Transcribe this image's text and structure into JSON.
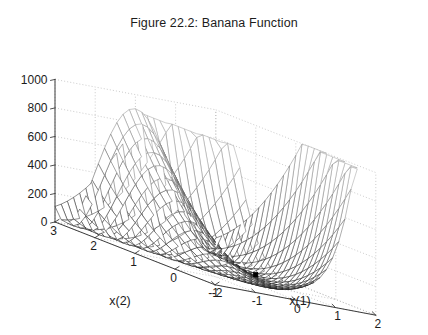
{
  "figure": {
    "title": "Figure 22.2: Banana Function",
    "background_color": "#ffffff",
    "axis_color": "#3c3c3c",
    "grid_color": "#b4b4b4",
    "mesh_color": "#303030",
    "marker_color": "#000000"
  },
  "axes": {
    "x1": {
      "label": "x(1)",
      "ticks": [
        "-2",
        "-1",
        "0",
        "1",
        "2"
      ],
      "tick_values": [
        -2,
        -1,
        0,
        1,
        2
      ],
      "range": [
        -2,
        2
      ]
    },
    "x2": {
      "label": "x(2)",
      "ticks": [
        "3",
        "2",
        "1",
        "0",
        "-1"
      ],
      "tick_values": [
        3,
        2,
        1,
        0,
        -1
      ],
      "range": [
        -1,
        3
      ]
    },
    "z": {
      "label": "",
      "ticks": [
        "0",
        "200",
        "400",
        "600",
        "800",
        "1000"
      ],
      "tick_values": [
        0,
        200,
        400,
        600,
        800,
        1000
      ],
      "range": [
        0,
        1000
      ]
    }
  },
  "marker": {
    "name": "minimum-marker",
    "x1": 1,
    "x2": 1,
    "z": 0,
    "size_px": 4.5
  },
  "chart_data": {
    "type": "surface",
    "title": "Figure 22.2: Banana Function",
    "xlabel": "x(1)",
    "ylabel": "x(2)",
    "zlabel": "",
    "xlim": [
      -2,
      2
    ],
    "ylim": [
      -1,
      3
    ],
    "zlim": [
      0,
      1000
    ],
    "grid": true,
    "legend": null,
    "function": "f(x1,x2) = 100*(x2 - x1^2)^2 + (1 - x1)^2",
    "function_name": "Rosenbrock banana function",
    "surface_style": "wireframe-mesh-white-faces",
    "grid_n": 26,
    "minimum": {
      "x1": 1,
      "x2": 1,
      "z": 0
    },
    "view": {
      "azimuth": -37.5,
      "elevation": 30
    },
    "annotations": [
      "black square marker at the function minimum (1, 1, 0)"
    ]
  }
}
